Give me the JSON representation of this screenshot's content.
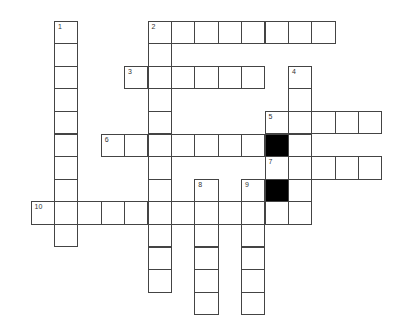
{
  "puzzle": {
    "grid": {
      "origin_x": 31,
      "origin_y": 21,
      "cell_w": 23.4,
      "cell_h": 22.6,
      "black_cells": [
        [
          5,
          10
        ],
        [
          7,
          10
        ]
      ],
      "numbers": [
        {
          "n": "1",
          "r": 0,
          "c": 1
        },
        {
          "n": "2",
          "r": 0,
          "c": 5
        },
        {
          "n": "3",
          "r": 2,
          "c": 4
        },
        {
          "n": "4",
          "r": 2,
          "c": 11
        },
        {
          "n": "5",
          "r": 4,
          "c": 10
        },
        {
          "n": "6",
          "r": 5,
          "c": 3
        },
        {
          "n": "7",
          "r": 6,
          "c": 10
        },
        {
          "n": "8",
          "r": 7,
          "c": 7
        },
        {
          "n": "9",
          "r": 7,
          "c": 9
        },
        {
          "n": "10",
          "r": 8,
          "c": 0
        }
      ]
    },
    "entries": [
      {
        "number": "1",
        "direction": "down",
        "row": 0,
        "col": 1,
        "length": 10
      },
      {
        "number": "2",
        "direction": "across",
        "row": 0,
        "col": 5,
        "length": 8
      },
      {
        "number": "2",
        "direction": "down",
        "row": 0,
        "col": 5,
        "length": 12
      },
      {
        "number": "3",
        "direction": "across",
        "row": 2,
        "col": 4,
        "length": 6
      },
      {
        "number": "4",
        "direction": "down",
        "row": 2,
        "col": 11,
        "length": 7
      },
      {
        "number": "5",
        "direction": "across",
        "row": 4,
        "col": 10,
        "length": 5
      },
      {
        "number": "6",
        "direction": "across",
        "row": 5,
        "col": 3,
        "length": 8
      },
      {
        "number": "7",
        "direction": "across",
        "row": 6,
        "col": 10,
        "length": 5
      },
      {
        "number": "8",
        "direction": "down",
        "row": 7,
        "col": 7,
        "length": 6
      },
      {
        "number": "9",
        "direction": "down",
        "row": 7,
        "col": 9,
        "length": 6
      },
      {
        "number": "10",
        "direction": "across",
        "row": 8,
        "col": 0,
        "length": 12
      }
    ]
  }
}
